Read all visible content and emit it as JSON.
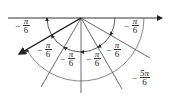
{
  "diagram": {
    "type": "angle-decomposition",
    "origin": [
      81,
      18
    ],
    "colors": {
      "line": "#333333",
      "bold": "#111111",
      "background": "#ffffff"
    },
    "labels": [
      {
        "id": "label-left",
        "sign": "−",
        "num": "π",
        "den": "6",
        "x": 22,
        "y": 21
      },
      {
        "id": "label-right",
        "sign": "−",
        "num": "π",
        "den": "6",
        "x": 130,
        "y": 21
      },
      {
        "id": "label-inner-1",
        "sign": "−",
        "num": "π",
        "den": "6",
        "x": 44,
        "y": 45
      },
      {
        "id": "label-inner-2",
        "sign": "−",
        "num": "π",
        "den": "6",
        "x": 67,
        "y": 55
      },
      {
        "id": "label-inner-3",
        "sign": "−",
        "num": "π",
        "den": "6",
        "x": 93,
        "y": 55
      },
      {
        "id": "label-inner-4",
        "sign": "−",
        "num": "π",
        "den": "6",
        "x": 113,
        "y": 45
      },
      {
        "id": "label-total",
        "sign": "−",
        "num": "5π",
        "den": "6",
        "x": 138,
        "y": 73
      }
    ]
  }
}
